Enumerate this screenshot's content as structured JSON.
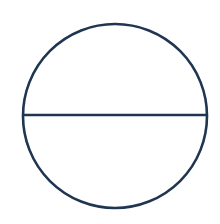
{
  "diagram": {
    "type": "circle-with-diameter",
    "canvas": {
      "width": 220,
      "height": 224,
      "background": "#ffffff"
    },
    "circle": {
      "cx": 115,
      "cy": 116,
      "r": 92,
      "stroke": "#1f3550",
      "stroke_width": 2.6,
      "fill": "none"
    },
    "diameter": {
      "x1": 23,
      "y1": 115,
      "x2": 207,
      "y2": 115,
      "stroke": "#1f3550",
      "stroke_width": 2.6,
      "orientation": "horizontal"
    }
  }
}
